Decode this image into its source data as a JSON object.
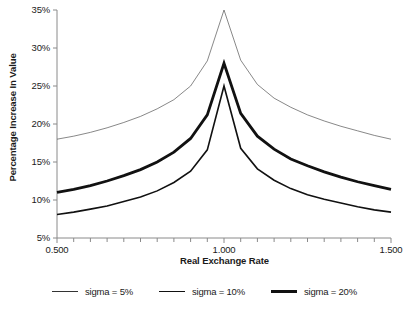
{
  "chart_data": {
    "type": "line",
    "title": "",
    "xlabel": "Real Exchange Rate",
    "ylabel": "Percentage Increase In Value",
    "xlim": [
      0.5,
      1.5
    ],
    "ylim": [
      5,
      35
    ],
    "grid": false,
    "legend_position": "bottom",
    "xticks": [
      "0.500",
      "1.000",
      "1.500"
    ],
    "xtick_values": [
      0.5,
      1.0,
      1.5
    ],
    "xminor_step": 0.05,
    "yticks": [
      "5%",
      "10%",
      "15%",
      "20%",
      "25%",
      "30%",
      "35%"
    ],
    "ytick_values": [
      5,
      10,
      15,
      20,
      25,
      30,
      35
    ],
    "x": [
      0.5,
      0.55,
      0.6,
      0.65,
      0.7,
      0.75,
      0.8,
      0.85,
      0.9,
      0.95,
      1.0,
      1.05,
      1.1,
      1.15,
      1.2,
      1.25,
      1.3,
      1.35,
      1.4,
      1.45,
      1.5
    ],
    "series": [
      {
        "name": "sigma = 5%",
        "linewidth": 0.7,
        "color": "#555555",
        "values": [
          18.0,
          18.4,
          18.9,
          19.5,
          20.2,
          21.0,
          22.0,
          23.2,
          25.0,
          28.3,
          35.0,
          28.4,
          25.2,
          23.4,
          22.2,
          21.2,
          20.4,
          19.7,
          19.1,
          18.5,
          18.0
        ]
      },
      {
        "name": "sigma = 10%",
        "linewidth": 1.6,
        "color": "#111111",
        "values": [
          8.1,
          8.4,
          8.8,
          9.2,
          9.8,
          10.4,
          11.2,
          12.3,
          13.8,
          16.6,
          25.0,
          16.8,
          14.1,
          12.6,
          11.5,
          10.7,
          10.1,
          9.6,
          9.1,
          8.7,
          8.4
        ]
      },
      {
        "name": "sigma = 20%",
        "linewidth": 2.8,
        "color": "#111111",
        "values": [
          11.0,
          11.4,
          11.9,
          12.5,
          13.2,
          14.0,
          15.0,
          16.3,
          18.1,
          21.2,
          28.0,
          21.4,
          18.4,
          16.7,
          15.4,
          14.5,
          13.7,
          13.0,
          12.4,
          11.9,
          11.4
        ]
      }
    ]
  },
  "legend": {
    "items": [
      {
        "label": "sigma = 5%",
        "linewidth": 0.8,
        "color": "#333333"
      },
      {
        "label": "sigma = 10%",
        "linewidth": 1.8,
        "color": "#111111"
      },
      {
        "label": "sigma = 20%",
        "linewidth": 3.0,
        "color": "#111111"
      }
    ]
  },
  "axes": {
    "axis_color": "#8a8a8a"
  }
}
